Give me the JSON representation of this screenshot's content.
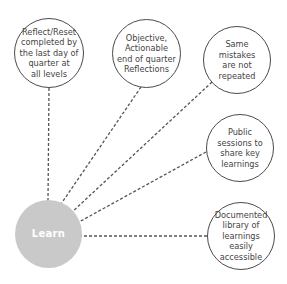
{
  "diagram": {
    "hub": {
      "label": "Learn"
    },
    "nodes": [
      {
        "id": "reflect-reset",
        "label": "Reflect/Reset\ncompleted by\nthe last day of\nquarter at\nall levels"
      },
      {
        "id": "objective-reflections",
        "label": "Objective,\nActionable\nend of quarter\nReflections"
      },
      {
        "id": "same-mistakes",
        "label": "Same mistakes\nare not\nrepeated"
      },
      {
        "id": "public-sessions",
        "label": "Public\nsessions to\nshare key\nlearnings"
      },
      {
        "id": "documented-library",
        "label": "Documented\nlibrary of\nlearnings easily\naccessible"
      }
    ],
    "colors": {
      "hub_fill": "#c9c9c9",
      "hub_text": "#ffffff",
      "node_border": "#4a4a4a",
      "node_text": "#444444",
      "connector": "#555555"
    }
  }
}
